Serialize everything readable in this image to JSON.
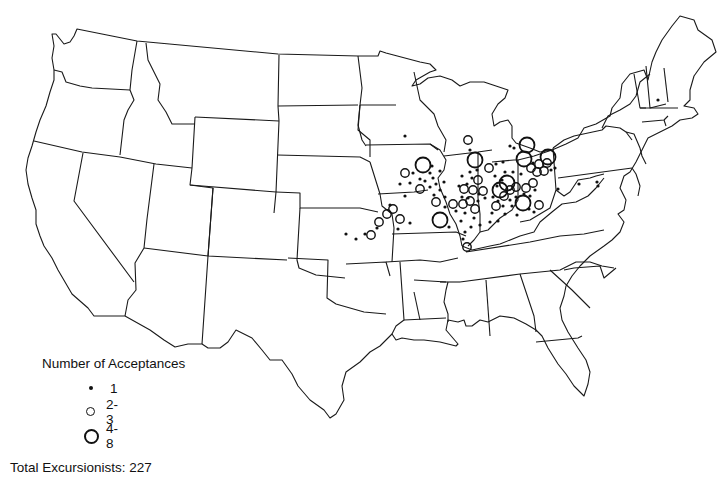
{
  "legend": {
    "title": "Number of Acceptances",
    "items": [
      {
        "symbol": "small-dot",
        "label": "1"
      },
      {
        "symbol": "medium-circle",
        "label": "2-3"
      },
      {
        "symbol": "large-circle",
        "label": "4-8"
      }
    ],
    "total_label": "Total Excursionists:  227"
  },
  "map": {
    "subject": "United States (contiguous)",
    "marker_styles": {
      "small-dot": {
        "r": 1.6
      },
      "medium-circle": {
        "r": 4.2,
        "stroke": 1.4
      },
      "large-circle": {
        "r": 7.5,
        "stroke": 1.8
      }
    },
    "markers": [
      {
        "x": 346,
        "y": 234,
        "t": "small-dot"
      },
      {
        "x": 356,
        "y": 239,
        "t": "small-dot"
      },
      {
        "x": 365,
        "y": 234,
        "t": "small-dot"
      },
      {
        "x": 371,
        "y": 235,
        "t": "medium-circle"
      },
      {
        "x": 377,
        "y": 228,
        "t": "small-dot"
      },
      {
        "x": 379,
        "y": 222,
        "t": "medium-circle"
      },
      {
        "x": 387,
        "y": 214,
        "t": "medium-circle"
      },
      {
        "x": 393,
        "y": 209,
        "t": "medium-circle"
      },
      {
        "x": 390,
        "y": 205,
        "t": "small-dot"
      },
      {
        "x": 400,
        "y": 219,
        "t": "medium-circle"
      },
      {
        "x": 398,
        "y": 229,
        "t": "small-dot"
      },
      {
        "x": 410,
        "y": 223,
        "t": "small-dot"
      },
      {
        "x": 405,
        "y": 136,
        "t": "small-dot"
      },
      {
        "x": 423,
        "y": 165,
        "t": "large-circle"
      },
      {
        "x": 432,
        "y": 166,
        "t": "small-dot"
      },
      {
        "x": 405,
        "y": 173,
        "t": "medium-circle"
      },
      {
        "x": 413,
        "y": 173,
        "t": "small-dot"
      },
      {
        "x": 400,
        "y": 184,
        "t": "small-dot"
      },
      {
        "x": 410,
        "y": 183,
        "t": "small-dot"
      },
      {
        "x": 420,
        "y": 179,
        "t": "small-dot"
      },
      {
        "x": 430,
        "y": 173,
        "t": "small-dot"
      },
      {
        "x": 440,
        "y": 171,
        "t": "small-dot"
      },
      {
        "x": 425,
        "y": 181,
        "t": "small-dot"
      },
      {
        "x": 433,
        "y": 178,
        "t": "small-dot"
      },
      {
        "x": 420,
        "y": 189,
        "t": "medium-circle"
      },
      {
        "x": 430,
        "y": 187,
        "t": "small-dot"
      },
      {
        "x": 436,
        "y": 184,
        "t": "small-dot"
      },
      {
        "x": 444,
        "y": 182,
        "t": "small-dot"
      },
      {
        "x": 440,
        "y": 190,
        "t": "small-dot"
      },
      {
        "x": 434,
        "y": 195,
        "t": "small-dot"
      },
      {
        "x": 445,
        "y": 197,
        "t": "small-dot"
      },
      {
        "x": 405,
        "y": 196,
        "t": "small-dot"
      },
      {
        "x": 436,
        "y": 202,
        "t": "medium-circle"
      },
      {
        "x": 445,
        "y": 207,
        "t": "small-dot"
      },
      {
        "x": 440,
        "y": 220,
        "t": "large-circle"
      },
      {
        "x": 449,
        "y": 227,
        "t": "small-dot"
      },
      {
        "x": 468,
        "y": 140,
        "t": "medium-circle"
      },
      {
        "x": 470,
        "y": 150,
        "t": "small-dot"
      },
      {
        "x": 475,
        "y": 160,
        "t": "large-circle"
      },
      {
        "x": 477,
        "y": 170,
        "t": "small-dot"
      },
      {
        "x": 470,
        "y": 172,
        "t": "small-dot"
      },
      {
        "x": 472,
        "y": 178,
        "t": "small-dot"
      },
      {
        "x": 462,
        "y": 176,
        "t": "small-dot"
      },
      {
        "x": 478,
        "y": 180,
        "t": "medium-circle"
      },
      {
        "x": 467,
        "y": 184,
        "t": "small-dot"
      },
      {
        "x": 459,
        "y": 186,
        "t": "small-dot"
      },
      {
        "x": 464,
        "y": 189,
        "t": "medium-circle"
      },
      {
        "x": 473,
        "y": 190,
        "t": "medium-circle"
      },
      {
        "x": 483,
        "y": 191,
        "t": "medium-circle"
      },
      {
        "x": 479,
        "y": 194,
        "t": "small-dot"
      },
      {
        "x": 462,
        "y": 197,
        "t": "small-dot"
      },
      {
        "x": 468,
        "y": 198,
        "t": "small-dot"
      },
      {
        "x": 478,
        "y": 201,
        "t": "small-dot"
      },
      {
        "x": 453,
        "y": 204,
        "t": "medium-circle"
      },
      {
        "x": 463,
        "y": 204,
        "t": "medium-circle"
      },
      {
        "x": 470,
        "y": 201,
        "t": "medium-circle"
      },
      {
        "x": 475,
        "y": 209,
        "t": "medium-circle"
      },
      {
        "x": 485,
        "y": 198,
        "t": "small-dot"
      },
      {
        "x": 456,
        "y": 211,
        "t": "small-dot"
      },
      {
        "x": 465,
        "y": 213,
        "t": "small-dot"
      },
      {
        "x": 474,
        "y": 218,
        "t": "small-dot"
      },
      {
        "x": 461,
        "y": 221,
        "t": "small-dot"
      },
      {
        "x": 471,
        "y": 227,
        "t": "small-dot"
      },
      {
        "x": 480,
        "y": 225,
        "t": "small-dot"
      },
      {
        "x": 465,
        "y": 232,
        "t": "small-dot"
      },
      {
        "x": 467,
        "y": 247,
        "t": "medium-circle"
      },
      {
        "x": 463,
        "y": 239,
        "t": "small-dot"
      },
      {
        "x": 489,
        "y": 168,
        "t": "medium-circle"
      },
      {
        "x": 496,
        "y": 164,
        "t": "small-dot"
      },
      {
        "x": 503,
        "y": 162,
        "t": "small-dot"
      },
      {
        "x": 505,
        "y": 172,
        "t": "small-dot"
      },
      {
        "x": 513,
        "y": 172,
        "t": "small-dot"
      },
      {
        "x": 495,
        "y": 176,
        "t": "small-dot"
      },
      {
        "x": 502,
        "y": 180,
        "t": "small-dot"
      },
      {
        "x": 497,
        "y": 186,
        "t": "small-dot"
      },
      {
        "x": 507,
        "y": 183,
        "t": "large-circle"
      },
      {
        "x": 500,
        "y": 190,
        "t": "large-circle"
      },
      {
        "x": 510,
        "y": 190,
        "t": "medium-circle"
      },
      {
        "x": 516,
        "y": 187,
        "t": "medium-circle"
      },
      {
        "x": 504,
        "y": 196,
        "t": "medium-circle"
      },
      {
        "x": 493,
        "y": 197,
        "t": "small-dot"
      },
      {
        "x": 498,
        "y": 201,
        "t": "small-dot"
      },
      {
        "x": 510,
        "y": 200,
        "t": "small-dot"
      },
      {
        "x": 516,
        "y": 197,
        "t": "small-dot"
      },
      {
        "x": 496,
        "y": 206,
        "t": "medium-circle"
      },
      {
        "x": 503,
        "y": 206,
        "t": "small-dot"
      },
      {
        "x": 512,
        "y": 206,
        "t": "small-dot"
      },
      {
        "x": 492,
        "y": 213,
        "t": "small-dot"
      },
      {
        "x": 505,
        "y": 214,
        "t": "small-dot"
      },
      {
        "x": 517,
        "y": 215,
        "t": "small-dot"
      },
      {
        "x": 490,
        "y": 222,
        "t": "small-dot"
      },
      {
        "x": 498,
        "y": 221,
        "t": "small-dot"
      },
      {
        "x": 510,
        "y": 146,
        "t": "small-dot"
      },
      {
        "x": 514,
        "y": 148,
        "t": "small-dot"
      },
      {
        "x": 527,
        "y": 145,
        "t": "large-circle"
      },
      {
        "x": 524,
        "y": 159,
        "t": "large-circle"
      },
      {
        "x": 533,
        "y": 163,
        "t": "small-dot"
      },
      {
        "x": 539,
        "y": 164,
        "t": "medium-circle"
      },
      {
        "x": 547,
        "y": 163,
        "t": "medium-circle"
      },
      {
        "x": 548,
        "y": 157,
        "t": "large-circle"
      },
      {
        "x": 531,
        "y": 168,
        "t": "medium-circle"
      },
      {
        "x": 537,
        "y": 172,
        "t": "medium-circle"
      },
      {
        "x": 544,
        "y": 171,
        "t": "medium-circle"
      },
      {
        "x": 551,
        "y": 170,
        "t": "small-dot"
      },
      {
        "x": 555,
        "y": 168,
        "t": "small-dot"
      },
      {
        "x": 521,
        "y": 174,
        "t": "small-dot"
      },
      {
        "x": 533,
        "y": 183,
        "t": "medium-circle"
      },
      {
        "x": 526,
        "y": 188,
        "t": "medium-circle"
      },
      {
        "x": 535,
        "y": 190,
        "t": "small-dot"
      },
      {
        "x": 524,
        "y": 194,
        "t": "small-dot"
      },
      {
        "x": 530,
        "y": 196,
        "t": "small-dot"
      },
      {
        "x": 523,
        "y": 203,
        "t": "large-circle"
      },
      {
        "x": 529,
        "y": 209,
        "t": "small-dot"
      },
      {
        "x": 539,
        "y": 205,
        "t": "medium-circle"
      },
      {
        "x": 534,
        "y": 212,
        "t": "small-dot"
      },
      {
        "x": 558,
        "y": 189,
        "t": "small-dot"
      },
      {
        "x": 579,
        "y": 184,
        "t": "small-dot"
      },
      {
        "x": 597,
        "y": 182,
        "t": "small-dot"
      },
      {
        "x": 598,
        "y": 186,
        "t": "small-dot"
      },
      {
        "x": 658,
        "y": 100,
        "t": "small-dot"
      }
    ]
  }
}
